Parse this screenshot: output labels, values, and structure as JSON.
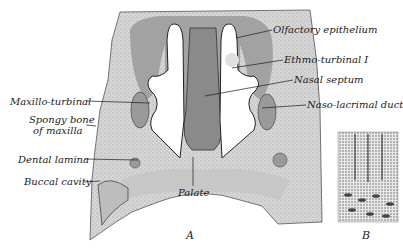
{
  "figure": {
    "panels": [
      {
        "id": "A",
        "label": "A",
        "description": "Frontal section through nasal cavity of fetus"
      },
      {
        "id": "B",
        "label": "B",
        "description": "Olfactory epithelium detail"
      }
    ],
    "labels": {
      "olfactory_epithelium": "Olfactory epithelium",
      "ethmo_turbinal": "Ethmo-turbinal I",
      "nasal_septum": "Nasal septum",
      "naso_lacrimal_duct": "Naso-lacrimal duct",
      "maxillo_turbinal": "Maxillo-turbinal",
      "spongy_bone_line1": "Spongy bone",
      "spongy_bone_line2": "of maxilla",
      "dental_lamina": "Dental lamina",
      "buccal_cavity": "Buccal cavity",
      "palate": "Palate"
    },
    "colors": {
      "tissue_light": "#d9d9d9",
      "tissue_mid": "#a8a8a8",
      "tissue_dark": "#8a8a8a",
      "outline": "#2a2a2a",
      "background": "#ffffff"
    }
  }
}
